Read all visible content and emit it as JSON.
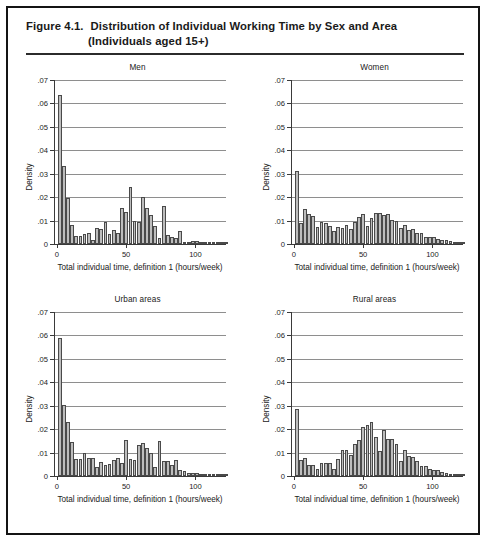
{
  "figure": {
    "number": "Figure 4.1.",
    "title_line1": "Distribution of Individual Working Time by Sex and Area",
    "title_line2": "(Individuals aged 15+)"
  },
  "axis": {
    "ylabel": "Density",
    "xlabel": "Total individual time, definition 1 (hours/week)",
    "yticks": [
      "0",
      ".01",
      ".02",
      ".03",
      ".04",
      ".05",
      ".06",
      ".07"
    ],
    "ytick_values": [
      0,
      0.01,
      0.02,
      0.03,
      0.04,
      0.05,
      0.06,
      0.07
    ],
    "xticks": [
      "0",
      "50",
      "100"
    ],
    "xtick_values": [
      0,
      50,
      100
    ],
    "ylim": [
      0,
      0.07
    ],
    "xlim": [
      -2,
      122
    ]
  },
  "colors": {
    "bar_fill": "#bdbdbd",
    "bar_edge": "#4a4a4a",
    "gridline": "#8e8e8e",
    "axis": "#3a3a3a",
    "border": "#141414",
    "text": "#1a1a1a"
  },
  "chart_data": [
    {
      "type": "bar",
      "title": "Men",
      "xlabel": "Total individual time, definition 1 (hours/week)",
      "ylabel": "Density",
      "xlim": [
        -2,
        122
      ],
      "ylim": [
        0,
        0.07
      ],
      "grid": true,
      "bin_width": 3,
      "x": [
        0,
        3,
        6,
        9,
        12,
        15,
        18,
        21,
        24,
        27,
        30,
        33,
        36,
        39,
        42,
        45,
        48,
        51,
        54,
        57,
        60,
        63,
        66,
        69,
        72,
        75,
        78,
        81,
        84,
        87,
        90,
        93,
        96,
        99,
        102,
        105,
        108,
        111,
        114,
        117,
        120
      ],
      "values": [
        0.0635,
        0.0333,
        0.0196,
        0.008,
        0.0034,
        0.0033,
        0.0042,
        0.0046,
        0.0016,
        0.0069,
        0.0064,
        0.0094,
        0.0042,
        0.0059,
        0.0047,
        0.0155,
        0.0135,
        0.0244,
        0.01,
        0.0096,
        0.02,
        0.0155,
        0.0123,
        0.0079,
        0.0024,
        0.0162,
        0.0038,
        0.0029,
        0.0026,
        0.0054,
        0.001,
        0.0007,
        0.0014,
        0.0013,
        0.0004,
        0.0009,
        0.0007,
        0.0003,
        0.0004,
        0.0003,
        0.0006
      ]
    },
    {
      "type": "bar",
      "title": "Women",
      "xlabel": "Total individual time, definition 1 (hours/week)",
      "ylabel": "Density",
      "xlim": [
        -2,
        122
      ],
      "ylim": [
        0,
        0.07
      ],
      "grid": true,
      "bin_width": 3,
      "x": [
        0,
        3,
        6,
        9,
        12,
        15,
        18,
        21,
        24,
        27,
        30,
        33,
        36,
        39,
        42,
        45,
        48,
        51,
        54,
        57,
        60,
        63,
        66,
        69,
        72,
        75,
        78,
        81,
        84,
        87,
        90,
        93,
        96,
        99,
        102,
        105,
        108,
        111,
        114,
        117,
        120
      ],
      "values": [
        0.031,
        0.009,
        0.015,
        0.0129,
        0.0118,
        0.0073,
        0.0096,
        0.0091,
        0.0078,
        0.0054,
        0.0071,
        0.0068,
        0.0082,
        0.0066,
        0.0096,
        0.0115,
        0.013,
        0.0079,
        0.011,
        0.0133,
        0.0131,
        0.0122,
        0.0126,
        0.0102,
        0.0098,
        0.007,
        0.0083,
        0.006,
        0.0063,
        0.0045,
        0.0046,
        0.003,
        0.0028,
        0.0029,
        0.002,
        0.0018,
        0.0016,
        0.0013,
        0.001,
        0.0009,
        0.0007
      ]
    },
    {
      "type": "bar",
      "title": "Urban areas",
      "xlabel": "Total individual time, definition 1 (hours/week)",
      "ylabel": "Density",
      "xlim": [
        -2,
        122
      ],
      "ylim": [
        0,
        0.07
      ],
      "grid": true,
      "bin_width": 3,
      "x": [
        0,
        3,
        6,
        9,
        12,
        15,
        18,
        21,
        24,
        27,
        30,
        33,
        36,
        39,
        42,
        45,
        48,
        51,
        54,
        57,
        60,
        63,
        66,
        69,
        72,
        75,
        78,
        81,
        84,
        87,
        90,
        93,
        96,
        99,
        102,
        105,
        108,
        111,
        114,
        117,
        120
      ],
      "values": [
        0.059,
        0.0303,
        0.0231,
        0.0144,
        0.0073,
        0.0074,
        0.0097,
        0.0078,
        0.0077,
        0.004,
        0.0058,
        0.0047,
        0.0051,
        0.0067,
        0.0077,
        0.0056,
        0.0152,
        0.0072,
        0.0068,
        0.0133,
        0.014,
        0.012,
        0.0098,
        0.004,
        0.015,
        0.0065,
        0.0065,
        0.0047,
        0.007,
        0.0027,
        0.0023,
        0.0013,
        0.0015,
        0.0013,
        0.0008,
        0.0008,
        0.0007,
        0.0009,
        0.0006,
        0.0005,
        0.0005
      ]
    },
    {
      "type": "bar",
      "title": "Rural areas",
      "xlabel": "Total individual time, definition 1 (hours/week)",
      "ylabel": "Density",
      "xlim": [
        -2,
        122
      ],
      "ylim": [
        0,
        0.07
      ],
      "grid": true,
      "bin_width": 3,
      "x": [
        0,
        3,
        6,
        9,
        12,
        15,
        18,
        21,
        24,
        27,
        30,
        33,
        36,
        39,
        42,
        45,
        48,
        51,
        54,
        57,
        60,
        63,
        66,
        69,
        72,
        75,
        78,
        81,
        84,
        87,
        90,
        93,
        96,
        99,
        102,
        105,
        108,
        111,
        114,
        117,
        120
      ],
      "values": [
        0.0285,
        0.0067,
        0.0075,
        0.0049,
        0.0049,
        0.0032,
        0.0054,
        0.0057,
        0.0057,
        0.0029,
        0.0073,
        0.0113,
        0.011,
        0.0088,
        0.0135,
        0.0155,
        0.021,
        0.0219,
        0.0229,
        0.0168,
        0.0108,
        0.0195,
        0.0156,
        0.016,
        0.0136,
        0.0065,
        0.011,
        0.0085,
        0.008,
        0.0062,
        0.0044,
        0.0041,
        0.0029,
        0.0024,
        0.0024,
        0.0017,
        0.0013,
        0.001,
        0.0009,
        0.0007,
        0.0004
      ]
    }
  ]
}
